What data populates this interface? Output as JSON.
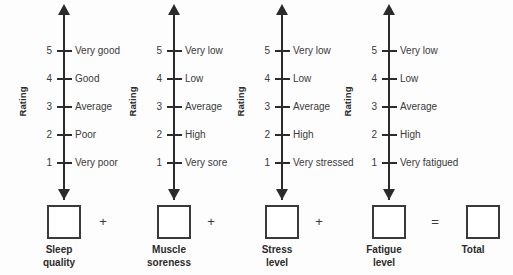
{
  "sheet": {
    "name": "wellness-questionnaire",
    "rating_caption": "Rating",
    "operators": {
      "plus": "+",
      "equals": "="
    },
    "colors": {
      "ink": "#2b2b2b",
      "text": "#3a3a3a",
      "background": "#fdfdfd"
    }
  },
  "scales": [
    {
      "id": "sleep-quality",
      "caption_lines": [
        "Sleep",
        "quality"
      ],
      "rating_caption": "Rating",
      "ticks": [
        {
          "value": "5",
          "label": "Very good"
        },
        {
          "value": "4",
          "label": "Good"
        },
        {
          "value": "3",
          "label": "Average"
        },
        {
          "value": "2",
          "label": "Poor"
        },
        {
          "value": "1",
          "label": "Very poor"
        }
      ],
      "entry_value": ""
    },
    {
      "id": "muscle-soreness",
      "caption_lines": [
        "Muscle",
        "soreness"
      ],
      "rating_caption": "Rating",
      "ticks": [
        {
          "value": "5",
          "label": "Very low"
        },
        {
          "value": "4",
          "label": "Low"
        },
        {
          "value": "3",
          "label": "Average"
        },
        {
          "value": "2",
          "label": "High"
        },
        {
          "value": "1",
          "label": "Very sore"
        }
      ],
      "entry_value": ""
    },
    {
      "id": "stress-level",
      "caption_lines": [
        "Stress",
        "level"
      ],
      "rating_caption": "Rating",
      "ticks": [
        {
          "value": "5",
          "label": "Very low"
        },
        {
          "value": "4",
          "label": "Low"
        },
        {
          "value": "3",
          "label": "Average"
        },
        {
          "value": "2",
          "label": "High"
        },
        {
          "value": "1",
          "label": "Very stressed"
        }
      ],
      "entry_value": ""
    },
    {
      "id": "fatigue-level",
      "caption_lines": [
        "Fatigue",
        "level"
      ],
      "rating_caption": "Rating",
      "ticks": [
        {
          "value": "5",
          "label": "Very low"
        },
        {
          "value": "4",
          "label": "Low"
        },
        {
          "value": "3",
          "label": "Average"
        },
        {
          "value": "2",
          "label": "High"
        },
        {
          "value": "1",
          "label": "Very fatigued"
        }
      ],
      "entry_value": ""
    }
  ],
  "total": {
    "id": "total",
    "caption_lines": [
      "Total"
    ],
    "entry_value": ""
  },
  "chart_data": {
    "type": "table",
    "title": "",
    "xlabel": "",
    "ylabel": "Rating",
    "categories": [
      "Sleep quality",
      "Muscle soreness",
      "Stress level",
      "Fatigue level"
    ],
    "scale_points": [
      5,
      4,
      3,
      2,
      1
    ],
    "ylim": [
      1,
      5
    ],
    "grid": false,
    "legend": "none",
    "series": [
      {
        "name": "Sleep quality",
        "anchors": [
          "Very good",
          "Good",
          "Average",
          "Poor",
          "Very poor"
        ]
      },
      {
        "name": "Muscle soreness",
        "anchors": [
          "Very low",
          "Low",
          "Average",
          "High",
          "Very sore"
        ]
      },
      {
        "name": "Stress level",
        "anchors": [
          "Very low",
          "Low",
          "Average",
          "High",
          "Very stressed"
        ]
      },
      {
        "name": "Fatigue level",
        "anchors": [
          "Very low",
          "Low",
          "Average",
          "High",
          "Very fatigued"
        ]
      }
    ],
    "summation": "Sleep quality + Muscle soreness + Stress level + Fatigue level = Total"
  }
}
